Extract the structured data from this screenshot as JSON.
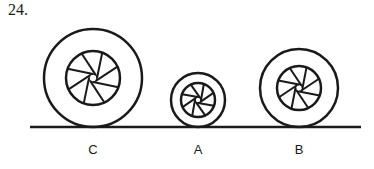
{
  "question_number": "24.",
  "wheels": [
    {
      "id": "C",
      "label": "C",
      "size_rank": "large"
    },
    {
      "id": "A",
      "label": "A",
      "size_rank": "small"
    },
    {
      "id": "B",
      "label": "B",
      "size_rank": "medium"
    }
  ],
  "spokes_per_wheel": 8,
  "colors": {
    "ink": "#1a1a1a",
    "background": "#ffffff"
  }
}
